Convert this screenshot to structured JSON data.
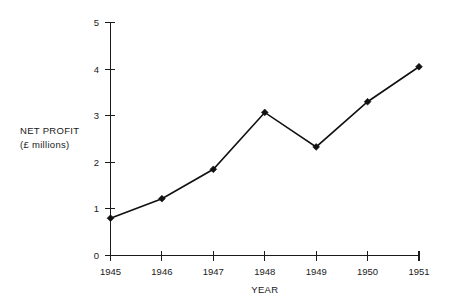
{
  "chart_data": {
    "type": "line",
    "title": "",
    "subtitle": "",
    "xlabel": "YEAR",
    "ylabel": "NET PROFIT (£ millions)",
    "ylabel_line1": "NET PROFIT",
    "ylabel_line2": "(£ millions)",
    "categories": [
      "1945",
      "1946",
      "1947",
      "1948",
      "1949",
      "1950",
      "1951"
    ],
    "x": [
      1945,
      1946,
      1947,
      1948,
      1949,
      1950,
      1951
    ],
    "values": [
      0.8,
      1.22,
      1.85,
      3.07,
      2.33,
      3.3,
      4.05
    ],
    "series": [
      {
        "name": "Net profit",
        "values": [
          0.8,
          1.22,
          1.85,
          3.07,
          2.33,
          3.3,
          4.05
        ]
      }
    ],
    "xlim": [
      1945,
      1951
    ],
    "ylim": [
      0,
      5
    ],
    "ytick_labels": [
      "0",
      "1",
      "2",
      "3",
      "4",
      "5"
    ],
    "ytick_values": [
      0,
      1,
      2,
      3,
      4,
      5
    ],
    "xtick_labels": [
      "1945",
      "1946",
      "1947",
      "1948",
      "1949",
      "1950",
      "1951"
    ],
    "grid": false,
    "legend": false,
    "legend_position": "none",
    "marker": "filled-diamond",
    "line_color": "#111111",
    "marker_color": "#111111",
    "axis_color": "#1a1a1a",
    "background_color": "#ffffff"
  },
  "axes": {
    "y_axis_name": "net-profit-axis",
    "x_axis_name": "year-axis"
  }
}
